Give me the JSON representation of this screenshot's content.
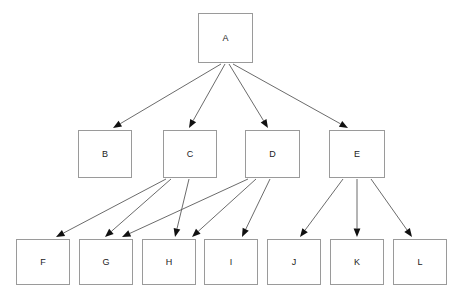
{
  "diagram": {
    "type": "directed-graph",
    "canvas": {
      "width": 460,
      "height": 302,
      "background": "#ffffff"
    },
    "style": {
      "node_border_color": "#9a9a9a",
      "node_fill_color": "#ffffff",
      "edge_color": "#5a5a5a",
      "arrow_color": "#111111",
      "label_color": "#1b1b1b",
      "label_font_size": 9
    },
    "levels": [
      {
        "index": 0,
        "node_ids": [
          "A"
        ]
      },
      {
        "index": 1,
        "node_ids": [
          "B",
          "C",
          "D",
          "E"
        ]
      },
      {
        "index": 2,
        "node_ids": [
          "F",
          "G",
          "H",
          "I",
          "J",
          "K",
          "L"
        ]
      }
    ],
    "nodes": [
      {
        "id": "A",
        "label": "A",
        "x": 198,
        "y": 13,
        "width": 55,
        "height": 50
      },
      {
        "id": "B",
        "label": "B",
        "x": 78,
        "y": 130,
        "width": 54,
        "height": 48
      },
      {
        "id": "C",
        "label": "C",
        "x": 163,
        "y": 130,
        "width": 54,
        "height": 48
      },
      {
        "id": "D",
        "label": "D",
        "x": 245,
        "y": 130,
        "width": 55,
        "height": 48
      },
      {
        "id": "E",
        "label": "E",
        "x": 329,
        "y": 130,
        "width": 56,
        "height": 48
      },
      {
        "id": "F",
        "label": "F",
        "x": 16,
        "y": 239,
        "width": 54,
        "height": 46
      },
      {
        "id": "G",
        "label": "G",
        "x": 79,
        "y": 239,
        "width": 54,
        "height": 46
      },
      {
        "id": "H",
        "label": "H",
        "x": 142,
        "y": 239,
        "width": 54,
        "height": 46
      },
      {
        "id": "I",
        "label": "I",
        "x": 204,
        "y": 239,
        "width": 54,
        "height": 46
      },
      {
        "id": "J",
        "label": "J",
        "x": 267,
        "y": 239,
        "width": 54,
        "height": 46
      },
      {
        "id": "K",
        "label": "K",
        "x": 330,
        "y": 239,
        "width": 54,
        "height": 46
      },
      {
        "id": "L",
        "label": "L",
        "x": 393,
        "y": 239,
        "width": 54,
        "height": 46
      }
    ],
    "edges": [
      {
        "from": "A",
        "to": "B",
        "x1": 221,
        "y1": 64,
        "x2": 113,
        "y2": 128
      },
      {
        "from": "A",
        "to": "C",
        "x1": 225,
        "y1": 64,
        "x2": 189,
        "y2": 128
      },
      {
        "from": "A",
        "to": "D",
        "x1": 229,
        "y1": 64,
        "x2": 268,
        "y2": 128
      },
      {
        "from": "A",
        "to": "E",
        "x1": 233,
        "y1": 64,
        "x2": 348,
        "y2": 128
      },
      {
        "from": "C",
        "to": "F",
        "x1": 166,
        "y1": 179,
        "x2": 56,
        "y2": 237
      },
      {
        "from": "C",
        "to": "G",
        "x1": 171,
        "y1": 179,
        "x2": 105,
        "y2": 237
      },
      {
        "from": "C",
        "to": "H",
        "x1": 189,
        "y1": 179,
        "x2": 175,
        "y2": 237
      },
      {
        "from": "D",
        "to": "G",
        "x1": 248,
        "y1": 179,
        "x2": 122,
        "y2": 237
      },
      {
        "from": "D",
        "to": "H",
        "x1": 256,
        "y1": 179,
        "x2": 192,
        "y2": 237
      },
      {
        "from": "D",
        "to": "I",
        "x1": 270,
        "y1": 179,
        "x2": 242,
        "y2": 237
      },
      {
        "from": "E",
        "to": "J",
        "x1": 343,
        "y1": 179,
        "x2": 300,
        "y2": 237
      },
      {
        "from": "E",
        "to": "K",
        "x1": 357,
        "y1": 179,
        "x2": 357,
        "y2": 237
      },
      {
        "from": "E",
        "to": "L",
        "x1": 371,
        "y1": 179,
        "x2": 412,
        "y2": 237
      }
    ]
  }
}
